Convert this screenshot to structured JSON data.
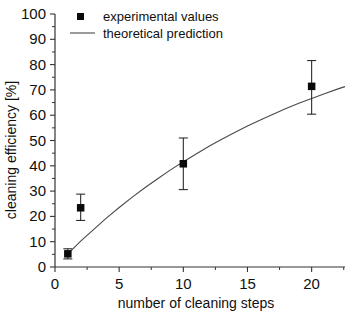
{
  "chart_data": {
    "type": "scatter",
    "title": "",
    "xlabel": "number of cleaning steps",
    "ylabel": "cleaning efficiency [%]",
    "xlim": [
      0,
      22.6
    ],
    "ylim": [
      0,
      100
    ],
    "xticks": [
      0,
      5,
      10,
      15,
      20
    ],
    "xtick_labels": [
      "0",
      "5",
      "10",
      "15",
      "20"
    ],
    "yticks": [
      0,
      10,
      20,
      30,
      40,
      50,
      60,
      70,
      80,
      90,
      100
    ],
    "ytick_labels": [
      "0",
      "10",
      "20",
      "30",
      "40",
      "50",
      "60",
      "70",
      "80",
      "90",
      "100"
    ],
    "grid": false,
    "legend_position": "top-left",
    "series": [
      {
        "name": "experimental values",
        "type": "scatter",
        "marker": "square",
        "color": "#0a0a0a",
        "x": [
          1,
          2,
          10,
          20
        ],
        "y": [
          5.2,
          23.4,
          40.8,
          71.4
        ],
        "yerr_low": [
          2.0,
          5.0,
          10.2,
          11.0
        ],
        "yerr_high": [
          2.0,
          5.4,
          10.2,
          10.2
        ]
      },
      {
        "name": "theoretical prediction",
        "type": "line",
        "color": "#4a4a4a",
        "x": [
          1,
          2,
          3,
          4,
          5,
          6,
          7,
          8,
          9,
          10,
          11,
          12,
          13,
          14,
          15,
          16,
          17,
          18,
          19,
          20,
          21,
          22,
          22.6
        ],
        "y": [
          5.2,
          10.2,
          14.8,
          19.3,
          23.5,
          27.5,
          31.3,
          34.9,
          38.4,
          41.6,
          44.7,
          47.7,
          50.5,
          53.2,
          55.7,
          58.1,
          60.4,
          62.6,
          64.7,
          66.6,
          68.5,
          70.3,
          71.3
        ]
      }
    ]
  },
  "legend": {
    "entries": [
      {
        "label": "experimental values",
        "symbol": "square-marker"
      },
      {
        "label": "theoretical prediction",
        "symbol": "line-sample"
      }
    ]
  },
  "axes": {
    "x_title": "number of cleaning steps",
    "y_title": "cleaning efficiency [%]"
  }
}
